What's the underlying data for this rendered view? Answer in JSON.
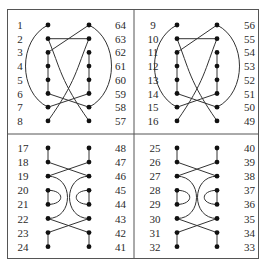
{
  "frame": {
    "x": 7,
    "y": 9,
    "width": 251,
    "height": 249,
    "divider_x": 134,
    "divider_y": 134
  },
  "panels": [
    {
      "id": "panel-top-left",
      "left_labels": [
        "1",
        "2",
        "3",
        "4",
        "5",
        "6",
        "7",
        "8"
      ],
      "right_labels": [
        "64",
        "63",
        "62",
        "61",
        "60",
        "59",
        "58",
        "57"
      ],
      "pattern": "top",
      "geom": {
        "label_left_x": 20,
        "dot_left_x": 48,
        "dot_right_x": 89,
        "label_right_x": 126,
        "y0": 25,
        "dy": 13.7
      }
    },
    {
      "id": "panel-top-right",
      "left_labels": [
        "9",
        "10",
        "11",
        "12",
        "13",
        "14",
        "15",
        "16"
      ],
      "right_labels": [
        "56",
        "55",
        "54",
        "53",
        "52",
        "51",
        "50",
        "49"
      ],
      "pattern": "top",
      "geom": {
        "label_left_x": 153,
        "dot_left_x": 177,
        "dot_right_x": 217,
        "label_right_x": 255,
        "y0": 25,
        "dy": 13.7
      }
    },
    {
      "id": "panel-bottom-left",
      "left_labels": [
        "17",
        "18",
        "19",
        "20",
        "21",
        "22",
        "23",
        "24"
      ],
      "right_labels": [
        "48",
        "47",
        "46",
        "45",
        "44",
        "43",
        "42",
        "41"
      ],
      "pattern": "bottom",
      "geom": {
        "label_left_x": 23,
        "dot_left_x": 48,
        "dot_right_x": 89,
        "label_right_x": 126,
        "y0": 148,
        "dy": 14.1
      }
    },
    {
      "id": "panel-bottom-right",
      "left_labels": [
        "25",
        "26",
        "27",
        "28",
        "29",
        "30",
        "31",
        "32"
      ],
      "right_labels": [
        "40",
        "39",
        "38",
        "37",
        "36",
        "35",
        "34",
        "33"
      ],
      "pattern": "bottom",
      "geom": {
        "label_left_x": 155,
        "dot_left_x": 177,
        "dot_right_x": 217,
        "label_right_x": 255,
        "y0": 148,
        "dy": 14.1
      }
    }
  ],
  "patterns": {
    "top": {
      "straight": [
        [
          "L1",
          "R1"
        ],
        [
          "R0",
          "L2"
        ],
        [
          "L2",
          "L3"
        ],
        [
          "L3",
          "L4"
        ],
        [
          "L4",
          "L5"
        ],
        [
          "R2",
          "R3"
        ],
        [
          "R3",
          "R4"
        ],
        [
          "R4",
          "R5"
        ],
        [
          "L5",
          "R6"
        ],
        [
          "R5",
          "L6"
        ]
      ],
      "outer_arcs": [
        [
          "L0",
          "L6"
        ],
        [
          "R0",
          "R6"
        ]
      ],
      "inner_curves": [
        [
          "L1",
          "R7"
        ],
        [
          "R1",
          "L7"
        ]
      ]
    },
    "bottom": {
      "straight": [
        [
          "L0",
          "L1"
        ],
        [
          "R0",
          "R1"
        ],
        [
          "L1",
          "R2"
        ],
        [
          "R1",
          "L2"
        ],
        [
          "L3",
          "L4"
        ],
        [
          "R3",
          "R4"
        ],
        [
          "L5",
          "R6"
        ],
        [
          "R5",
          "L6"
        ],
        [
          "L6",
          "L7"
        ],
        [
          "R6",
          "R7"
        ]
      ],
      "big_loops": [
        [
          "L2",
          "L5"
        ],
        [
          "R2",
          "R5"
        ]
      ],
      "small_loops": [
        [
          "L3",
          "L4"
        ],
        [
          "R3",
          "R4"
        ]
      ]
    }
  }
}
